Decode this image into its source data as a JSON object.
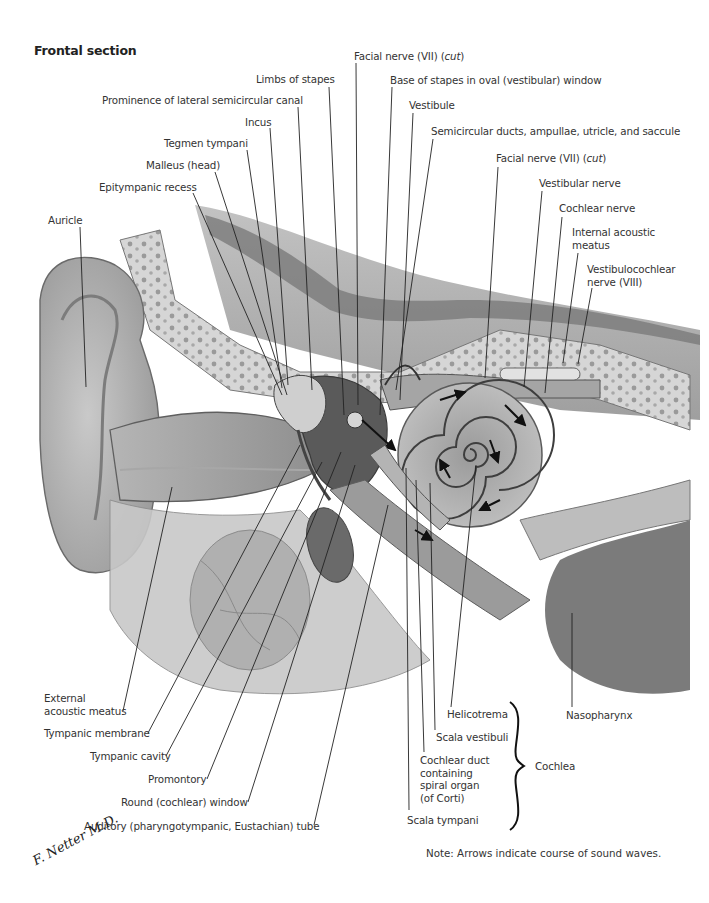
{
  "figure": {
    "title": "Frontal section",
    "note": "Note: Arrows indicate course of sound waves.",
    "signature": "F. Netter M.D.",
    "palette": {
      "ink": "#333333",
      "line": "#222222",
      "background": "#ffffff",
      "bone_light": "#d8d8d8",
      "bone_dark": "#8a8a8a",
      "tissue": "#bdbdbd",
      "cavity": "#6e6e6e"
    }
  },
  "labels": {
    "facial_nerve_cut_1": {
      "text": "Facial nerve (VII)",
      "italic": "cut"
    },
    "limbs_of_stapes": "Limbs of stapes",
    "base_of_stapes": "Base of stapes in oval (vestibular) window",
    "prominence_lateral_semicircular": "Prominence of lateral semicircular canal",
    "vestibule": "Vestibule",
    "incus": "Incus",
    "semicircular_ducts": "Semicircular ducts, ampullae, utricle, and saccule",
    "tegmen_tympani": "Tegmen tympani",
    "facial_nerve_cut_2": {
      "text": "Facial nerve (VII)",
      "italic": "cut"
    },
    "malleus_head": "Malleus (head)",
    "vestibular_nerve": "Vestibular nerve",
    "epitympanic_recess": "Epitympanic recess",
    "cochlear_nerve": "Cochlear nerve",
    "internal_acoustic_meatus": "Internal acoustic\nmeatus",
    "auricle": "Auricle",
    "vestibulocochlear_nerve": "Vestibulocochlear\nnerve (VIII)",
    "external_acoustic_meatus": "External\nacoustic meatus",
    "tympanic_membrane": "Tympanic membrane",
    "tympanic_cavity": "Tympanic cavity",
    "promontory": "Promontory",
    "round_window": "Round (cochlear) window",
    "auditory_tube": "Auditory (pharyngotympanic, Eustachian) tube",
    "helicotrema": "Helicotrema",
    "nasopharynx": "Nasopharynx",
    "scala_vestibuli": "Scala vestibuli",
    "cochlear_duct": "Cochlear duct\ncontaining\nspiral organ\n(of Corti)",
    "scala_tympani": "Scala tympani",
    "cochlea": "Cochlea"
  }
}
